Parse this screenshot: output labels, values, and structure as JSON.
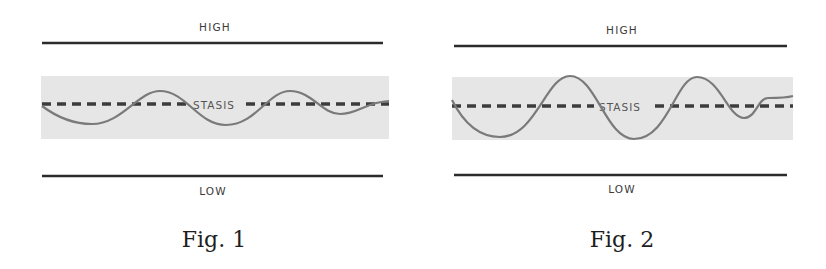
{
  "colors": {
    "limit_line": "#2b2b2b",
    "band": "#e6e6e6",
    "stasis_line": "#3c3c3c",
    "wave": "#7a7a7a",
    "text": "#3a3a3a"
  },
  "figures": [
    {
      "caption": "Fig. 1",
      "high_label": "HIGH",
      "low_label": "LOW",
      "stasis_label": "STASIS",
      "wave_description": "small oscillation staying within the stasis band"
    },
    {
      "caption": "Fig. 2",
      "high_label": "HIGH",
      "low_label": "LOW",
      "stasis_label": "STASIS",
      "wave_description": "larger oscillation reaching the edges of the stasis band"
    }
  ]
}
